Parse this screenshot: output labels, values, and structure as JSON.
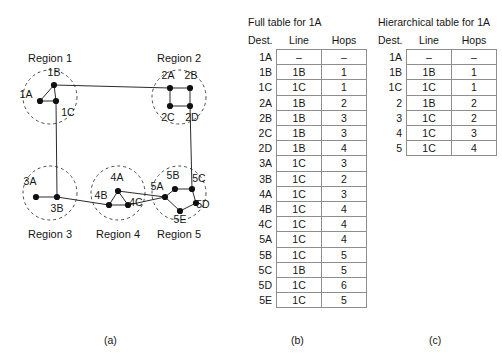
{
  "figure": {
    "captions": {
      "a": "(a)",
      "b": "(b)",
      "c": "(c)"
    }
  },
  "diagram": {
    "regions": [
      {
        "id": "r1",
        "label": "Region 1",
        "cx": 50,
        "cy": 97,
        "r": 27,
        "label_x": 50,
        "label_y": 62
      },
      {
        "id": "r2",
        "label": "Region 2",
        "cx": 179,
        "cy": 97,
        "r": 27,
        "label_x": 179,
        "label_y": 62
      },
      {
        "id": "r3",
        "label": "Region 3",
        "cx": 50,
        "cy": 193,
        "r": 27,
        "label_x": 50,
        "label_y": 238
      },
      {
        "id": "r4",
        "label": "Region 4",
        "cx": 118,
        "cy": 193,
        "r": 27,
        "label_x": 118,
        "label_y": 238
      },
      {
        "id": "r5",
        "label": "Region 5",
        "cx": 179,
        "cy": 193,
        "r": 27,
        "label_x": 179,
        "label_y": 238
      }
    ],
    "nodes": [
      {
        "id": "1A",
        "x": 40,
        "y": 101,
        "label": "1A",
        "lx": 26,
        "ly": 98
      },
      {
        "id": "1B",
        "x": 54,
        "y": 85,
        "label": "1B",
        "lx": 54,
        "ly": 76
      },
      {
        "id": "1C",
        "x": 56,
        "y": 101,
        "label": "1C",
        "lx": 68,
        "ly": 116
      },
      {
        "id": "2A",
        "x": 170,
        "y": 88,
        "label": "2A",
        "lx": 168,
        "ly": 79
      },
      {
        "id": "2B",
        "x": 190,
        "y": 88,
        "label": "2B",
        "lx": 191,
        "ly": 79
      },
      {
        "id": "2C",
        "x": 170,
        "y": 106,
        "label": "2C",
        "lx": 168,
        "ly": 121
      },
      {
        "id": "2D",
        "x": 190,
        "y": 106,
        "label": "2D",
        "lx": 192,
        "ly": 121
      },
      {
        "id": "3A",
        "x": 36,
        "y": 197,
        "label": "3A",
        "lx": 30,
        "ly": 185
      },
      {
        "id": "3B",
        "x": 57,
        "y": 197,
        "label": "3B",
        "lx": 57,
        "ly": 212
      },
      {
        "id": "4A",
        "x": 118,
        "y": 191,
        "label": "4A",
        "lx": 117,
        "ly": 181
      },
      {
        "id": "4B",
        "x": 109,
        "y": 205,
        "label": "4B",
        "lx": 101,
        "ly": 199
      },
      {
        "id": "4C",
        "x": 128,
        "y": 205,
        "label": "4C",
        "lx": 136,
        "ly": 206
      },
      {
        "id": "5A",
        "x": 165,
        "y": 197,
        "label": "5A",
        "lx": 157,
        "ly": 190
      },
      {
        "id": "5B",
        "x": 175,
        "y": 189,
        "label": "5B",
        "lx": 173,
        "ly": 179
      },
      {
        "id": "5C",
        "x": 192,
        "y": 189,
        "label": "5C",
        "lx": 199,
        "ly": 182
      },
      {
        "id": "5D",
        "x": 196,
        "y": 203,
        "label": "5D",
        "lx": 203,
        "ly": 208
      },
      {
        "id": "5E",
        "x": 180,
        "y": 211,
        "label": "5E",
        "lx": 180,
        "ly": 223
      }
    ],
    "links": [
      [
        "1A",
        "1B"
      ],
      [
        "1A",
        "1C"
      ],
      [
        "1B",
        "1C"
      ],
      [
        "2A",
        "2B"
      ],
      [
        "2A",
        "2C"
      ],
      [
        "2B",
        "2D"
      ],
      [
        "2C",
        "2D"
      ],
      [
        "3A",
        "3B"
      ],
      [
        "4A",
        "4B"
      ],
      [
        "4A",
        "4C"
      ],
      [
        "4B",
        "4C"
      ],
      [
        "5A",
        "5B"
      ],
      [
        "5B",
        "5C"
      ],
      [
        "5C",
        "5D"
      ],
      [
        "5D",
        "5E"
      ],
      [
        "5E",
        "5A"
      ],
      [
        "1B",
        "2A"
      ],
      [
        "1C",
        "3B"
      ],
      [
        "2D",
        "5C"
      ],
      [
        "3B",
        "4B"
      ],
      [
        "4A",
        "5A"
      ],
      [
        "4C",
        "5A"
      ]
    ]
  },
  "full_table": {
    "title": "Full table for 1A",
    "headers": {
      "dest": "Dest.",
      "line": "Line",
      "hops": "Hops"
    },
    "rows": [
      {
        "dest": "1A",
        "line": "–",
        "hops": "–"
      },
      {
        "dest": "1B",
        "line": "1B",
        "hops": "1"
      },
      {
        "dest": "1C",
        "line": "1C",
        "hops": "1"
      },
      {
        "dest": "2A",
        "line": "1B",
        "hops": "2"
      },
      {
        "dest": "2B",
        "line": "1B",
        "hops": "3"
      },
      {
        "dest": "2C",
        "line": "1B",
        "hops": "3"
      },
      {
        "dest": "2D",
        "line": "1B",
        "hops": "4"
      },
      {
        "dest": "3A",
        "line": "1C",
        "hops": "3"
      },
      {
        "dest": "3B",
        "line": "1C",
        "hops": "2"
      },
      {
        "dest": "4A",
        "line": "1C",
        "hops": "3"
      },
      {
        "dest": "4B",
        "line": "1C",
        "hops": "4"
      },
      {
        "dest": "4C",
        "line": "1C",
        "hops": "4"
      },
      {
        "dest": "5A",
        "line": "1C",
        "hops": "4"
      },
      {
        "dest": "5B",
        "line": "1C",
        "hops": "5"
      },
      {
        "dest": "5C",
        "line": "1B",
        "hops": "5"
      },
      {
        "dest": "5D",
        "line": "1C",
        "hops": "6"
      },
      {
        "dest": "5E",
        "line": "1C",
        "hops": "5"
      }
    ]
  },
  "hier_table": {
    "title": "Hierarchical table for 1A",
    "headers": {
      "dest": "Dest.",
      "line": "Line",
      "hops": "Hops"
    },
    "rows": [
      {
        "dest": "1A",
        "line": "–",
        "hops": "–"
      },
      {
        "dest": "1B",
        "line": "1B",
        "hops": "1"
      },
      {
        "dest": "1C",
        "line": "1C",
        "hops": "1"
      },
      {
        "dest": "2",
        "line": "1B",
        "hops": "2"
      },
      {
        "dest": "3",
        "line": "1C",
        "hops": "2"
      },
      {
        "dest": "4",
        "line": "1C",
        "hops": "3"
      },
      {
        "dest": "5",
        "line": "1C",
        "hops": "4"
      }
    ]
  }
}
